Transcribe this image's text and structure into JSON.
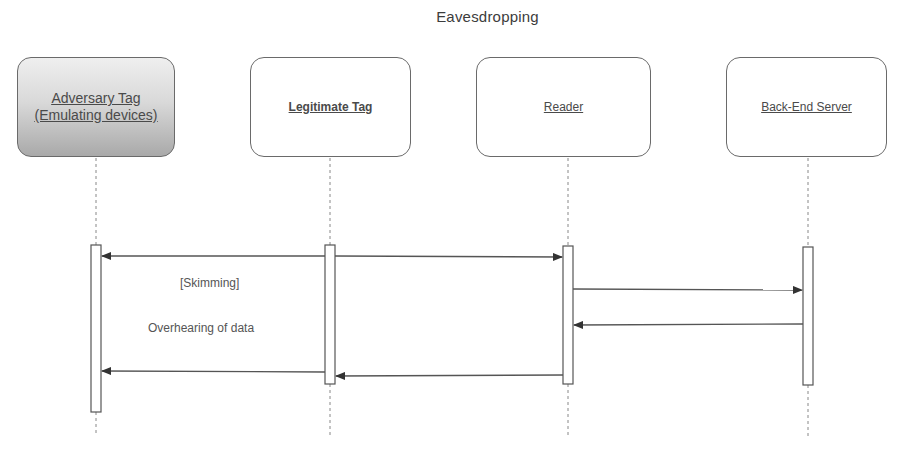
{
  "diagram": {
    "title": "Eavesdropping",
    "type": "sequence-diagram",
    "actors": [
      {
        "id": "adversary",
        "label_line1": "Adversary Tag",
        "label_line2": "(Emulating devices)",
        "fill": "gradient-gray"
      },
      {
        "id": "legitimate",
        "label": "Legitimate Tag",
        "fill": "#ffffff"
      },
      {
        "id": "reader",
        "label": "Reader",
        "fill": "#ffffff"
      },
      {
        "id": "server",
        "label": "Back-End Server",
        "fill": "#ffffff"
      }
    ],
    "messages": [
      {
        "from": "legitimate",
        "to": "reader",
        "label": ""
      },
      {
        "from": "legitimate",
        "to": "adversary",
        "label": ""
      },
      {
        "from": "reader",
        "to": "server",
        "label": ""
      },
      {
        "from": "server",
        "to": "reader",
        "label": ""
      },
      {
        "from": "reader",
        "to": "legitimate",
        "label": ""
      },
      {
        "from": "legitimate",
        "to": "adversary",
        "label": ""
      }
    ],
    "annotations": {
      "skimming": "[Skimming]",
      "overhearing": "Overhearing of data"
    },
    "colors": {
      "line": "#555555",
      "box_border": "#6a6a6a",
      "text": "#4a4a4a"
    }
  }
}
